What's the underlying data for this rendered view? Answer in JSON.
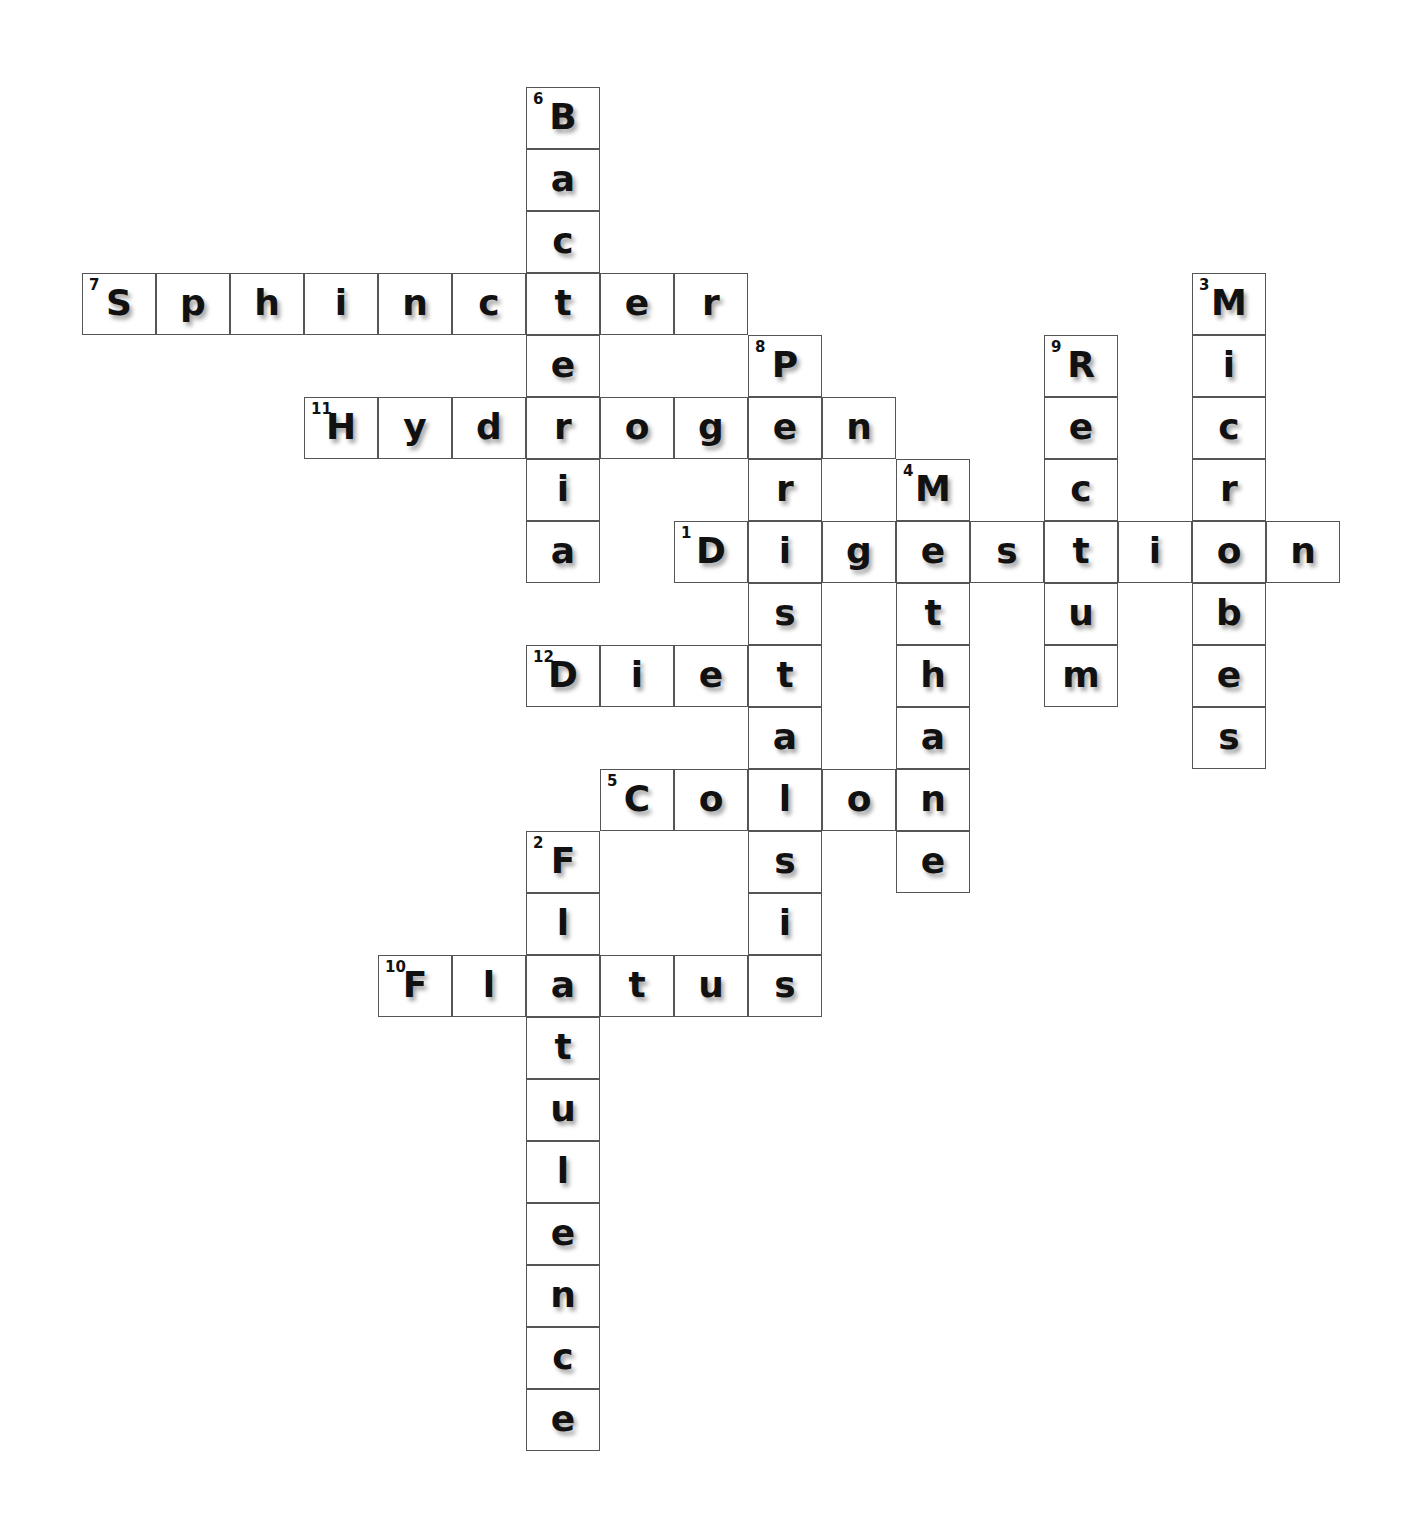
{
  "puzzle": {
    "type": "crossword",
    "words": [
      {
        "number": "7",
        "answer": "Sphincter",
        "direction": "across",
        "row": 3,
        "col": 0
      },
      {
        "number": "11",
        "answer": "Hydrogen",
        "direction": "across",
        "row": 5,
        "col": 3
      },
      {
        "number": "1",
        "answer": "Digestion",
        "direction": "across",
        "row": 7,
        "col": 8
      },
      {
        "number": "12",
        "answer": "Diet",
        "direction": "across",
        "row": 9,
        "col": 6
      },
      {
        "number": "5",
        "answer": "Colon",
        "direction": "across",
        "row": 11,
        "col": 7
      },
      {
        "number": "10",
        "answer": "Flatus",
        "direction": "across",
        "row": 14,
        "col": 4
      },
      {
        "number": "6",
        "answer": "Bacteria",
        "direction": "down",
        "row": 0,
        "col": 6
      },
      {
        "number": "8",
        "answer": "Peristalsis",
        "direction": "down",
        "row": 4,
        "col": 9
      },
      {
        "number": "4",
        "answer": "Methane",
        "direction": "down",
        "row": 6,
        "col": 11
      },
      {
        "number": "9",
        "answer": "Rectum",
        "direction": "down",
        "row": 4,
        "col": 13
      },
      {
        "number": "3",
        "answer": "Microbes",
        "direction": "down",
        "row": 3,
        "col": 15
      },
      {
        "number": "2",
        "answer": "Flatulence",
        "direction": "down",
        "row": 12,
        "col": 6
      }
    ]
  }
}
